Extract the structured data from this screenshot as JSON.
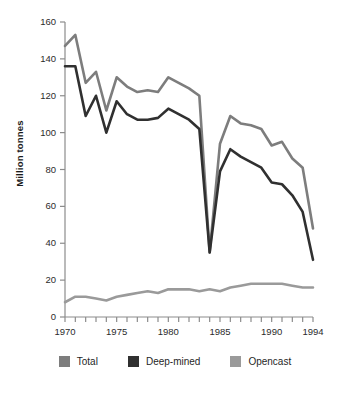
{
  "chart_data": {
    "type": "line",
    "title": "",
    "xlabel": "",
    "ylabel": "Million tonnes",
    "xlim": [
      1970,
      1994
    ],
    "ylim": [
      0,
      160
    ],
    "grid": false,
    "legend_position": "bottom",
    "x": [
      1970,
      1971,
      1972,
      1973,
      1974,
      1975,
      1976,
      1977,
      1978,
      1979,
      1980,
      1981,
      1982,
      1983,
      1984,
      1985,
      1986,
      1987,
      1988,
      1989,
      1990,
      1991,
      1992,
      1993,
      1994
    ],
    "x_tick_labels": [
      "1970",
      "1975",
      "1980",
      "1985",
      "1990",
      "1994"
    ],
    "x_tick_values": [
      1970,
      1975,
      1980,
      1985,
      1990,
      1994
    ],
    "y_tick_labels": [
      "0",
      "20",
      "40",
      "60",
      "80",
      "100",
      "120",
      "140",
      "160"
    ],
    "y_tick_values": [
      0,
      20,
      40,
      60,
      80,
      100,
      120,
      140,
      160
    ],
    "series": [
      {
        "name": "Total",
        "color": "#7d7d7d",
        "values": [
          147,
          153,
          127,
          133,
          112,
          130,
          125,
          122,
          123,
          122,
          130,
          127,
          124,
          120,
          35,
          94,
          109,
          105,
          104,
          102,
          93,
          95,
          86,
          81,
          48
        ]
      },
      {
        "name": "Deep-mined",
        "color": "#303030",
        "values": [
          136,
          136,
          109,
          120,
          100,
          117,
          110,
          107,
          107,
          108,
          113,
          110,
          107,
          102,
          35,
          79,
          91,
          87,
          84,
          81,
          73,
          72,
          66,
          57,
          31
        ]
      },
      {
        "name": "Opencast",
        "color": "#9a9a9a",
        "values": [
          8,
          11,
          11,
          10,
          9,
          11,
          12,
          13,
          14,
          13,
          15,
          15,
          15,
          14,
          15,
          14,
          16,
          17,
          18,
          18,
          18,
          18,
          17,
          16,
          16
        ]
      }
    ]
  },
  "axis": {
    "y_title": "Million tonnes"
  },
  "legend": {
    "items": [
      {
        "label": "Total",
        "color": "#7d7d7d"
      },
      {
        "label": "Deep-mined",
        "color": "#303030"
      },
      {
        "label": "Opencast",
        "color": "#9a9a9a"
      }
    ]
  }
}
